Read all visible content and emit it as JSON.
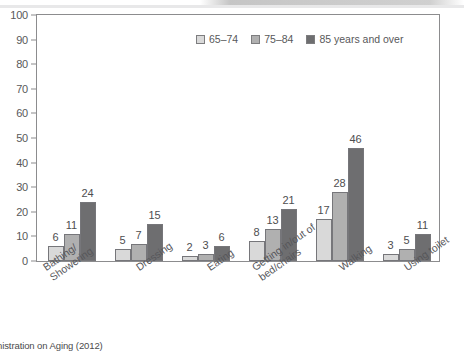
{
  "chart_data": {
    "type": "bar",
    "title": "",
    "subtitle": "",
    "xlabel": "",
    "ylabel": "",
    "ylim": [
      0,
      100
    ],
    "ytick_step": 10,
    "yticks": [
      "0",
      "10",
      "20",
      "30",
      "40",
      "50",
      "60",
      "70",
      "80",
      "90",
      "100"
    ],
    "grid": false,
    "legend_position": "top-right",
    "categories": [
      "Bathing/\nShowering",
      "Dressing",
      "Eating",
      "Getting in/out of\nbed/chairs",
      "Walking",
      "Using toilet"
    ],
    "series": [
      {
        "name": "65–74",
        "values": [
          6,
          5,
          2,
          8,
          17,
          3
        ],
        "color": "#d9d9d9"
      },
      {
        "name": "75–84",
        "values": [
          11,
          7,
          3,
          13,
          28,
          5
        ],
        "color": "#b0b0b0"
      },
      {
        "name": "85 years and over",
        "values": [
          24,
          15,
          6,
          21,
          46,
          11
        ],
        "color": "#6e6e70"
      }
    ],
    "data_labels": true
  },
  "legend": {
    "items": [
      {
        "label": "65–74",
        "color": "#d9d9d9"
      },
      {
        "label": "75–84",
        "color": "#b0b0b0"
      },
      {
        "label": "85 years and over",
        "color": "#6e6e70"
      }
    ]
  },
  "caption": {
    "text": "inistration on Aging (2012)"
  },
  "colors": {
    "axis": "#8c8c8e",
    "text": "#56565a",
    "background": "#ffffff"
  }
}
